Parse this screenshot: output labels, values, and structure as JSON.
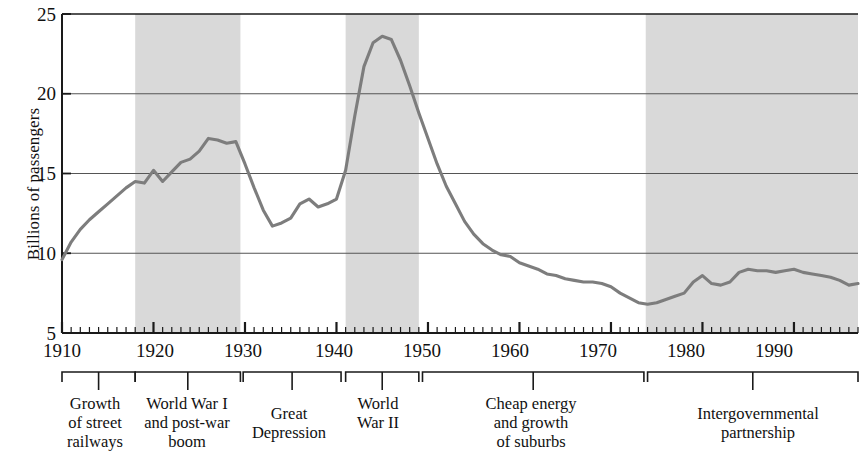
{
  "figure": {
    "y_axis_title": "Billions of passengers",
    "line_color": "#7d7d7d",
    "band_color": "#d9d9d9",
    "axis_color": "#1a1a1a",
    "grid_color": "#555555"
  },
  "chart_data": {
    "type": "line",
    "title": "",
    "xlabel": "",
    "ylabel": "Billions of passengers",
    "xlim": [
      1910,
      1997
    ],
    "ylim": [
      5,
      25
    ],
    "xticks": [
      1910,
      1920,
      1930,
      1940,
      1950,
      1960,
      1970,
      1980,
      1990
    ],
    "xtick_labels": [
      "1910",
      "1920",
      "1930",
      "1940",
      "1950",
      "1960",
      "1970",
      "1980",
      "1990"
    ],
    "yticks": [
      5,
      10,
      15,
      20,
      25
    ],
    "ytick_labels": [
      "5",
      "10",
      "15",
      "20",
      "25"
    ],
    "minor_xtick_interval": 1,
    "grid": "horizontal gridlines at 10, 15, 20",
    "legend": "none",
    "series": [
      {
        "name": "Transit passengers",
        "x": [
          1910,
          1911,
          1912,
          1913,
          1914,
          1915,
          1916,
          1917,
          1918,
          1919,
          1920,
          1921,
          1922,
          1923,
          1924,
          1925,
          1926,
          1927,
          1928,
          1929,
          1930,
          1931,
          1932,
          1933,
          1934,
          1935,
          1936,
          1937,
          1938,
          1939,
          1940,
          1941,
          1942,
          1943,
          1944,
          1945,
          1946,
          1947,
          1948,
          1949,
          1950,
          1951,
          1952,
          1953,
          1954,
          1955,
          1956,
          1957,
          1958,
          1959,
          1960,
          1961,
          1962,
          1963,
          1964,
          1965,
          1966,
          1967,
          1968,
          1969,
          1970,
          1971,
          1972,
          1973,
          1974,
          1975,
          1976,
          1977,
          1978,
          1979,
          1980,
          1981,
          1982,
          1983,
          1984,
          1985,
          1986,
          1987,
          1988,
          1989,
          1990,
          1991,
          1992,
          1993,
          1994,
          1995,
          1996,
          1997
        ],
        "values": [
          9.6,
          10.7,
          11.5,
          12.1,
          12.6,
          13.1,
          13.6,
          14.1,
          14.5,
          14.4,
          15.2,
          14.5,
          15.1,
          15.7,
          15.9,
          16.4,
          17.2,
          17.1,
          16.9,
          17.0,
          15.6,
          14.1,
          12.7,
          11.7,
          11.9,
          12.2,
          13.1,
          13.4,
          12.9,
          13.1,
          13.4,
          15.2,
          18.6,
          21.7,
          23.2,
          23.6,
          23.4,
          22.1,
          20.5,
          18.8,
          17.2,
          15.6,
          14.2,
          13.1,
          12.0,
          11.2,
          10.6,
          10.2,
          9.9,
          9.8,
          9.4,
          9.2,
          9.0,
          8.7,
          8.6,
          8.4,
          8.3,
          8.2,
          8.2,
          8.1,
          7.9,
          7.5,
          7.2,
          6.9,
          6.8,
          6.9,
          7.1,
          7.3,
          7.5,
          8.2,
          8.6,
          8.1,
          8.0,
          8.2,
          8.8,
          9.0,
          8.9,
          8.9,
          8.8,
          8.9,
          9.0,
          8.8,
          8.7,
          8.6,
          8.5,
          8.3,
          8.0,
          8.1
        ]
      }
    ],
    "shaded_bands": [
      {
        "label": "World War I and post-war boom band",
        "start": 1918,
        "end": 1929.5
      },
      {
        "label": "World War II band",
        "start": 1941,
        "end": 1949
      },
      {
        "label": "Intergovernmental partnership band",
        "start": 1973.8,
        "end": 1997
      }
    ],
    "annotations": [
      {
        "label": "Growth of street railways",
        "start": 1910,
        "end": 1918
      },
      {
        "label": "World War I and post-war boom",
        "start": 1918,
        "end": 1929.5
      },
      {
        "label": "Great Depression",
        "start": 1929.8,
        "end": 1940.5
      },
      {
        "label": "World War II",
        "start": 1941,
        "end": 1949
      },
      {
        "label": "Cheap energy and growth of suburbs",
        "start": 1949.4,
        "end": 1973.6
      },
      {
        "label": "Intergovernmental partnership",
        "start": 1974,
        "end": 1997
      }
    ]
  },
  "y_ticks": [
    {
      "value": "25"
    },
    {
      "value": "20"
    },
    {
      "value": "15"
    },
    {
      "value": "10"
    },
    {
      "value": "5"
    }
  ],
  "x_ticks": [
    {
      "label": "1910"
    },
    {
      "label": "1920"
    },
    {
      "label": "1930"
    },
    {
      "label": "1940"
    },
    {
      "label": "1950"
    },
    {
      "label": "1960"
    },
    {
      "label": "1970"
    },
    {
      "label": "1980"
    },
    {
      "label": "1990"
    }
  ],
  "eras": [
    {
      "label": "Growth\nof street\nrailways"
    },
    {
      "label": "World War I\nand post-war\nboom"
    },
    {
      "label": "Great\nDepression"
    },
    {
      "label": "World\nWar II"
    },
    {
      "label": "Cheap energy\nand growth\nof suburbs"
    },
    {
      "label": "Intergovernmental\npartnership"
    }
  ]
}
